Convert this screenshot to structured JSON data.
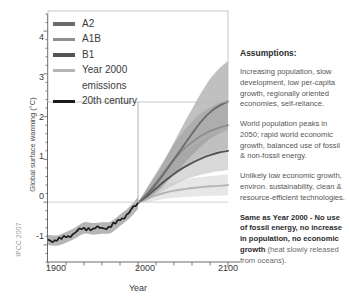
{
  "watermark": "IPCC 2007",
  "axes": {
    "ylabel": "Global surface warming (°C)",
    "xlabel": "Year",
    "yticks": [
      "4",
      "3",
      "2",
      "1",
      "0",
      "-1"
    ],
    "xticks": [
      "1900",
      "2000",
      "2100"
    ]
  },
  "legend": {
    "items": [
      {
        "label": "A2",
        "color": "#6b6b6b"
      },
      {
        "label": "A1B",
        "color": "#8f8f8f"
      },
      {
        "label": "B1",
        "color": "#555555"
      },
      {
        "label": "Year 2000",
        "label2": "emissions",
        "color": "#b4b4b4"
      },
      {
        "label": "20th century",
        "color": "#1a1a1a"
      }
    ]
  },
  "assumptions": {
    "title": "Assumptions:",
    "paragraphs": [
      {
        "text": "Increasing population, slow development, low per-capita growth, regionally oriented economies, self-reliance.",
        "bold": false
      },
      {
        "text": "World population peaks in 2050; rapid world economic growth, balanced use of fossil & non-fossil energy.",
        "bold": false
      },
      {
        "text": "Unlikely low economic growth, environ. sustainability, clean & resource-efficient technologies.",
        "bold": false
      },
      {
        "text": "Same as Year 2000 - No use of fossil energy, no increase in population, no economic growth",
        "sub": " (heat slowly released from oceans).",
        "bold": true
      }
    ]
  },
  "chart_data": {
    "type": "line",
    "title": "",
    "xlabel": "Year",
    "ylabel": "Global surface warming (°C)",
    "xlim": [
      1900,
      2100
    ],
    "ylim": [
      -1.4,
      4.4
    ],
    "grid": false,
    "reference_lines": [
      {
        "axis": "y",
        "value": 0
      },
      {
        "axis": "x",
        "value": 2000
      }
    ],
    "legend_position": "top-left-inside",
    "x_historical": [
      1900,
      1910,
      1920,
      1930,
      1940,
      1950,
      1960,
      1970,
      1980,
      1990,
      2000
    ],
    "x_projection": [
      2000,
      2010,
      2020,
      2030,
      2040,
      2050,
      2060,
      2070,
      2080,
      2090,
      2100
    ],
    "series": [
      {
        "name": "20th century",
        "color": "#1a1a1a",
        "x": [
          1900,
          1910,
          1920,
          1930,
          1940,
          1950,
          1960,
          1970,
          1980,
          1990,
          2000
        ],
        "values": [
          -0.88,
          -0.9,
          -0.82,
          -0.72,
          -0.6,
          -0.62,
          -0.6,
          -0.58,
          -0.42,
          -0.25,
          -0.02
        ],
        "band_low": [
          -1.0,
          -1.02,
          -0.95,
          -0.85,
          -0.74,
          -0.76,
          -0.74,
          -0.72,
          -0.56,
          -0.39,
          -0.16
        ],
        "band_high": [
          -0.76,
          -0.78,
          -0.7,
          -0.6,
          -0.47,
          -0.49,
          -0.47,
          -0.45,
          -0.29,
          -0.12,
          0.12
        ],
        "band_color": "#a8a8a8"
      },
      {
        "name": "A2",
        "color": "#6b6b6b",
        "x": [
          2000,
          2010,
          2020,
          2030,
          2040,
          2050,
          2060,
          2070,
          2080,
          2090,
          2100
        ],
        "values": [
          -0.02,
          0.18,
          0.42,
          0.7,
          1.0,
          1.3,
          1.6,
          1.88,
          2.1,
          2.25,
          2.35
        ],
        "band_low": [
          -0.02,
          0.05,
          0.22,
          0.42,
          0.65,
          0.88,
          1.1,
          1.3,
          1.48,
          1.6,
          1.68
        ],
        "band_high": [
          -0.02,
          0.32,
          0.64,
          1.0,
          1.4,
          1.8,
          2.18,
          2.55,
          2.88,
          3.12,
          3.3
        ],
        "band_color": "#9a9a9a"
      },
      {
        "name": "A1B",
        "color": "#8f8f8f",
        "x": [
          2000,
          2010,
          2020,
          2030,
          2040,
          2050,
          2060,
          2070,
          2080,
          2090,
          2100
        ],
        "values": [
          -0.02,
          0.2,
          0.46,
          0.74,
          1.0,
          1.22,
          1.4,
          1.55,
          1.66,
          1.74,
          1.8
        ],
        "band_low": [
          -0.02,
          0.08,
          0.27,
          0.47,
          0.66,
          0.82,
          0.96,
          1.06,
          1.14,
          1.2,
          1.24
        ],
        "band_high": [
          -0.02,
          0.34,
          0.68,
          1.02,
          1.36,
          1.64,
          1.88,
          2.08,
          2.22,
          2.32,
          2.4
        ],
        "band_color": "#b0b0b0"
      },
      {
        "name": "B1",
        "color": "#555555",
        "x": [
          2000,
          2010,
          2020,
          2030,
          2040,
          2050,
          2060,
          2070,
          2080,
          2090,
          2100
        ],
        "values": [
          -0.02,
          0.14,
          0.32,
          0.5,
          0.66,
          0.8,
          0.92,
          1.02,
          1.1,
          1.16,
          1.2
        ],
        "band_low": [
          -0.02,
          0.04,
          0.16,
          0.29,
          0.4,
          0.5,
          0.58,
          0.64,
          0.69,
          0.72,
          0.75
        ],
        "band_high": [
          -0.02,
          0.25,
          0.5,
          0.74,
          0.96,
          1.15,
          1.3,
          1.44,
          1.55,
          1.62,
          1.68
        ],
        "band_color": "#c2c2c2"
      },
      {
        "name": "Year 2000 emissions",
        "color": "#b4b4b4",
        "x": [
          2000,
          2010,
          2020,
          2030,
          2040,
          2050,
          2060,
          2070,
          2080,
          2090,
          2100
        ],
        "values": [
          -0.02,
          0.08,
          0.16,
          0.22,
          0.27,
          0.3,
          0.33,
          0.35,
          0.37,
          0.38,
          0.4
        ],
        "band_low": [
          -0.02,
          0.0,
          0.04,
          0.08,
          0.1,
          0.12,
          0.13,
          0.14,
          0.15,
          0.15,
          0.16
        ],
        "band_high": [
          -0.02,
          0.17,
          0.3,
          0.4,
          0.47,
          0.52,
          0.56,
          0.59,
          0.61,
          0.63,
          0.65
        ],
        "band_color": "#d8d8d8"
      }
    ]
  }
}
